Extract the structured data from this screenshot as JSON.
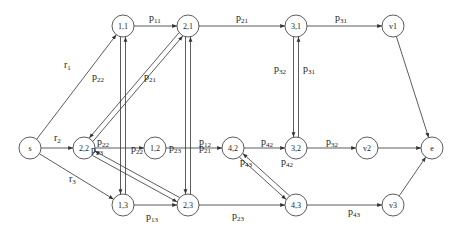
{
  "diagram": {
    "title": "",
    "nodes": [
      {
        "id": "s",
        "label": "s",
        "x": 30,
        "y": 148
      },
      {
        "id": "n11",
        "label": "1,1",
        "x": 123,
        "y": 26
      },
      {
        "id": "n22",
        "label": "2,2",
        "x": 84,
        "y": 148
      },
      {
        "id": "n12",
        "label": "1,2",
        "x": 155,
        "y": 148
      },
      {
        "id": "n13",
        "label": "1,3",
        "x": 123,
        "y": 205
      },
      {
        "id": "n21",
        "label": "2,1",
        "x": 188,
        "y": 26
      },
      {
        "id": "n23",
        "label": "2,3",
        "x": 188,
        "y": 205
      },
      {
        "id": "n42",
        "label": "4,2",
        "x": 233,
        "y": 148
      },
      {
        "id": "n31",
        "label": "3,1",
        "x": 296,
        "y": 26
      },
      {
        "id": "n32",
        "label": "3,2",
        "x": 296,
        "y": 148
      },
      {
        "id": "n43",
        "label": "4,3",
        "x": 296,
        "y": 205
      },
      {
        "id": "v1",
        "label": "v1",
        "x": 393,
        "y": 26
      },
      {
        "id": "v2",
        "label": "v2",
        "x": 367,
        "y": 148
      },
      {
        "id": "v3",
        "label": "v3",
        "x": 393,
        "y": 205
      },
      {
        "id": "e",
        "label": "e",
        "x": 432,
        "y": 148
      }
    ],
    "edges": [
      {
        "from": "s",
        "to": "n11",
        "label": "r",
        "sub": "1",
        "lx": 64,
        "ly": 68
      },
      {
        "from": "s",
        "to": "n22",
        "label": "r",
        "sub": "2",
        "lx": 54,
        "ly": 141
      },
      {
        "from": "s",
        "to": "n13",
        "label": "r",
        "sub": "3",
        "lx": 69,
        "ly": 182
      },
      {
        "from": "n11",
        "to": "n21",
        "label": "p",
        "sub": "11",
        "lx": 149,
        "ly": 21
      },
      {
        "from": "n21",
        "to": "n31",
        "label": "p",
        "sub": "21",
        "lx": 236,
        "ly": 21
      },
      {
        "from": "n31",
        "to": "v1",
        "label": "p",
        "sub": "31",
        "lx": 335,
        "ly": 21
      },
      {
        "from": "v1",
        "to": "e",
        "label": "",
        "sub": ""
      },
      {
        "from": "n22",
        "to": "n12",
        "label": "p",
        "sub": "22",
        "lx": 97,
        "ly": 145
      },
      {
        "from": "n12",
        "to": "n42",
        "label": "p",
        "sub": "12",
        "lx": 199,
        "ly": 145
      },
      {
        "from": "n42",
        "to": "n32",
        "label": "p",
        "sub": "42",
        "lx": 261,
        "ly": 145
      },
      {
        "from": "n32",
        "to": "v2",
        "label": "p",
        "sub": "32",
        "lx": 326,
        "ly": 145
      },
      {
        "from": "v2",
        "to": "e",
        "label": "",
        "sub": ""
      },
      {
        "from": "n13",
        "to": "n23",
        "label": "p",
        "sub": "13",
        "lx": 146,
        "ly": 220
      },
      {
        "from": "n23",
        "to": "n43",
        "label": "p",
        "sub": "23",
        "lx": 232,
        "ly": 219
      },
      {
        "from": "n43",
        "to": "v3",
        "label": "p",
        "sub": "43",
        "lx": 348,
        "ly": 215
      },
      {
        "from": "v3",
        "to": "e",
        "label": "",
        "sub": ""
      },
      {
        "from": "n22",
        "to": "n21",
        "label": "p",
        "sub": "21",
        "lx": 144,
        "ly": 80,
        "pair": true
      },
      {
        "from": "n21",
        "to": "n22",
        "label": "p",
        "sub": "22",
        "lx": 92,
        "ly": 80
      },
      {
        "from": "n22",
        "to": "n23",
        "label": "p",
        "sub": "22",
        "lx": 131,
        "ly": 152,
        "pair": true
      },
      {
        "from": "n23",
        "to": "n22",
        "label": "p",
        "sub": "23",
        "lx": 91,
        "ly": 153
      },
      {
        "from": "n11",
        "to": "n13",
        "label": "",
        "sub": ""
      },
      {
        "from": "n13",
        "to": "n11",
        "label": "",
        "sub": ""
      },
      {
        "from": "n21",
        "to": "n23",
        "label": "p",
        "sub": "21",
        "lx": 199,
        "ly": 151
      },
      {
        "from": "n23",
        "to": "n21",
        "label": "p",
        "sub": "23",
        "lx": 169,
        "ly": 151
      },
      {
        "from": "n31",
        "to": "n32",
        "label": "p",
        "sub": "31",
        "lx": 303,
        "ly": 72
      },
      {
        "from": "n32",
        "to": "n31",
        "label": "p",
        "sub": "32",
        "lx": 274,
        "ly": 72
      },
      {
        "from": "n42",
        "to": "n43",
        "label": "p",
        "sub": "42",
        "lx": 281,
        "ly": 165
      },
      {
        "from": "n43",
        "to": "n42",
        "label": "p",
        "sub": "43",
        "lx": 240,
        "ly": 165
      }
    ]
  }
}
